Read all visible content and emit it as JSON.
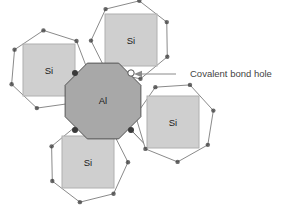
{
  "figure": {
    "type": "covalent-bond-diagram",
    "background_color": "#ffffff",
    "canvas": {
      "width": 293,
      "height": 205
    },
    "colors": {
      "center_atom_fill": "#a8a8a8",
      "center_atom_stroke": "#555555",
      "neighbor_shape_fill": "#ffffff",
      "neighbor_shape_stroke": "#8a8a8a",
      "neighbor_square_fill": "#cfcfcf",
      "neighbor_square_stroke": "#b0b0b0",
      "bond_dot_fill": "#3a3a3a",
      "hole_dot_fill": "#ffffff",
      "hole_dot_stroke": "#555555",
      "bond_line_stroke": "#6e6e6e",
      "leader_line_stroke": "#8a8a8a",
      "text_color": "#1a1a1a",
      "callout_text_color": "#444444"
    },
    "center_atom": {
      "label": "Al",
      "name": "aluminum",
      "shape": "octagon",
      "cx": 103,
      "cy": 101,
      "r": 41,
      "label_x": 103,
      "label_y": 101
    },
    "neighbor_atoms": [
      {
        "label": "Si",
        "name": "silicon-upper-left",
        "shape": "heptagon",
        "cx": 49,
        "cy": 70,
        "r": 40,
        "rotation": -8,
        "square_cx": 49,
        "square_cy": 70,
        "square_size": 52,
        "label_x": 49,
        "label_y": 71
      },
      {
        "label": "Si",
        "name": "silicon-upper-center",
        "shape": "heptagon",
        "cx": 131,
        "cy": 40,
        "r": 40,
        "rotation": 12,
        "square_cx": 131,
        "square_cy": 40,
        "square_size": 52,
        "label_x": 131,
        "label_y": 41
      },
      {
        "label": "Si",
        "name": "silicon-right",
        "shape": "heptagon",
        "cx": 175,
        "cy": 122,
        "r": 40,
        "rotation": 22,
        "square_cx": 173,
        "square_cy": 122,
        "square_size": 52,
        "label_x": 173,
        "label_y": 123
      },
      {
        "label": "Si",
        "name": "silicon-lower-left",
        "shape": "heptagon",
        "cx": 88,
        "cy": 163,
        "r": 40,
        "rotation": -14,
        "square_cx": 88,
        "square_cy": 162,
        "square_size": 52,
        "label_x": 88,
        "label_y": 163
      }
    ],
    "bond_dots": [
      {
        "name": "bond-dot-upper-left",
        "cx": 75,
        "cy": 73,
        "r": 3.0,
        "filled": true
      },
      {
        "name": "bond-dot-lower-left",
        "cx": 75,
        "cy": 130,
        "r": 3.0,
        "filled": true
      },
      {
        "name": "bond-dot-lower-right",
        "cx": 131,
        "cy": 130,
        "r": 3.0,
        "filled": true
      },
      {
        "name": "bond-dot-hole-upper-right",
        "cx": 131,
        "cy": 73,
        "r": 3.2,
        "filled": false
      }
    ],
    "callout": {
      "label": "Covalent bond hole",
      "text_x": 190,
      "text_y": 74,
      "leader_x1": 176,
      "leader_y1": 74,
      "leader_x2": 141,
      "leader_y2": 74,
      "arrow_tip_x": 134,
      "arrow_tip_y": 74
    }
  }
}
